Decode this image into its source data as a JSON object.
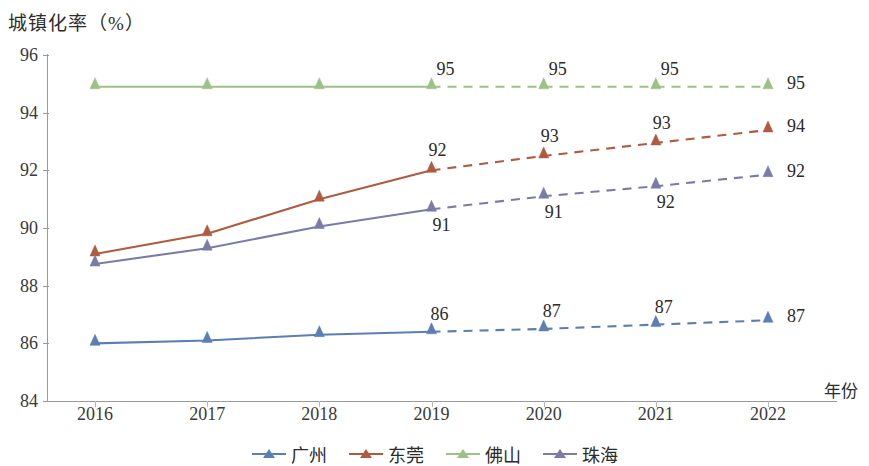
{
  "chart_data": {
    "type": "line",
    "title": "",
    "ylabel": "城镇化率（%）",
    "xlabel": "年份",
    "categories": [
      "2016",
      "2017",
      "2018",
      "2019",
      "2020",
      "2021",
      "2022"
    ],
    "ylim": [
      84,
      96
    ],
    "yticks": [
      84,
      86,
      88,
      90,
      92,
      94,
      96
    ],
    "grid": false,
    "legend_position": "bottom",
    "forecast_start_index": 3,
    "note": "实线为2016-2019实际值，虚线为2019-2022预测值并标注数据标签",
    "series": [
      {
        "name": "广州",
        "color": "#5b7fb5",
        "values": [
          86.0,
          86.1,
          86.3,
          86.4,
          86.5,
          86.65,
          86.8
        ],
        "labels": [
          "",
          "",
          "",
          "86",
          "87",
          "87",
          "87"
        ]
      },
      {
        "name": "东莞",
        "color": "#b05a40",
        "values": [
          89.1,
          89.8,
          91.0,
          92.0,
          92.5,
          92.95,
          93.4
        ],
        "labels": [
          "",
          "",
          "",
          "92",
          "93",
          "93",
          "94"
        ]
      },
      {
        "name": "佛山",
        "color": "#9dc183",
        "values": [
          94.9,
          94.9,
          94.9,
          94.9,
          94.9,
          94.9,
          94.9
        ],
        "labels": [
          "",
          "",
          "",
          "95",
          "95",
          "95",
          "95"
        ]
      },
      {
        "name": "珠海",
        "color": "#7b7ba8",
        "values": [
          88.75,
          89.3,
          90.05,
          90.65,
          91.1,
          91.45,
          91.85
        ],
        "labels": [
          "",
          "",
          "",
          "91",
          "91",
          "92",
          "92"
        ]
      }
    ]
  },
  "legend": {
    "items": [
      {
        "label": "广州",
        "color": "#5b7fb5"
      },
      {
        "label": "东莞",
        "color": "#b05a40"
      },
      {
        "label": "佛山",
        "color": "#9dc183"
      },
      {
        "label": "珠海",
        "color": "#7b7ba8"
      }
    ]
  }
}
